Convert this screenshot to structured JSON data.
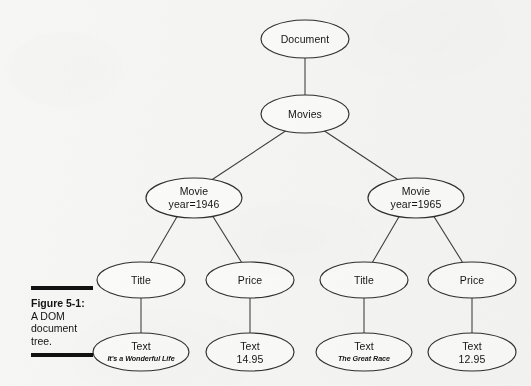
{
  "figure": {
    "caption_number": "Figure 5-1:",
    "caption_text": "A DOM document tree.",
    "background_color": "#f6f6f5",
    "line_color": "#2f2f2f",
    "text_color": "#151515",
    "rule_color": "#111111"
  },
  "diagram": {
    "type": "tree",
    "title": "DOM document tree",
    "nodes": {
      "document": {
        "label": "Document"
      },
      "movies": {
        "label": "Movies"
      },
      "movie_1946": {
        "label": "Movie",
        "attribute": "year=1946"
      },
      "movie_1965": {
        "label": "Movie",
        "attribute": "year=1965"
      },
      "title_left": {
        "label": "Title"
      },
      "price_left": {
        "label": "Price"
      },
      "title_right": {
        "label": "Title"
      },
      "price_right": {
        "label": "Price"
      },
      "text_title_left": {
        "label": "Text",
        "value": "It's a Wonderful Life"
      },
      "text_price_left": {
        "label": "Text",
        "value": "14.95"
      },
      "text_title_right": {
        "label": "Text",
        "value": "The Great Race"
      },
      "text_price_right": {
        "label": "Text",
        "value": "12.95"
      }
    }
  }
}
